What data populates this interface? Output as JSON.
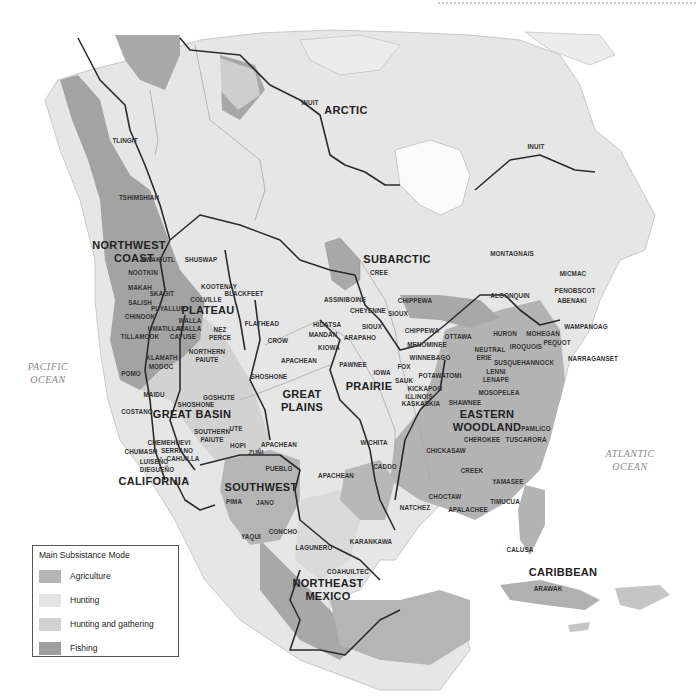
{
  "map": {
    "colors": {
      "agriculture": "#b5b5b5",
      "hunting": "#e4e4e4",
      "hunting_gathering": "#d2d2d2",
      "fishing": "#9e9e9e",
      "boundary": "#2b2b2b",
      "river": "#a9a9a9",
      "ocean": "#ffffff"
    },
    "regions": {
      "arctic": "ARCTIC",
      "subarctic": "SUBARCTIC",
      "northwest_coast_1": "NORTHWEST",
      "northwest_coast_2": "COAST",
      "plateau": "PLATEAU",
      "great_basin": "GREAT BASIN",
      "great_plains_1": "GREAT",
      "great_plains_2": "PLAINS",
      "prairie": "PRAIRIE",
      "eastern_woodland_1": "EASTERN",
      "eastern_woodland_2": "WOODLAND",
      "california": "CALIFORNIA",
      "southwest": "SOUTHWEST",
      "northeast_mexico_1": "NORTHEAST",
      "northeast_mexico_2": "MEXICO",
      "caribbean": "CARIBBEAN"
    },
    "oceans": {
      "pacific_1": "PACIFIC",
      "pacific_2": "OCEAN",
      "atlantic_1": "ATLANTIC",
      "atlantic_2": "OCEAN"
    },
    "tribes": {
      "inuit_west": "INUIT",
      "inuit_east": "INUIT",
      "tlingit": "TLINGIT",
      "tshimshian": "TSHIMSHIAN",
      "kwakiutl": "KWAKIUTL",
      "nootkin": "NOOTKIN",
      "makah": "MAKAH",
      "salish": "SALISH",
      "chinook": "CHINOOK",
      "tillamook": "TILLAMOOK",
      "skagit": "SKAGIT",
      "puyallup": "PUYALLUP",
      "umatilla": "UMATILLA",
      "walla_walla_1": "WALLA",
      "walla_walla_2": "WALLA",
      "cayuse": "CAYUSE",
      "klamath": "KLAMATH",
      "modoc": "MODOC",
      "pomo": "POMO",
      "shuswap": "SHUSWAP",
      "kootenay": "KOOTENAY",
      "blackfeet": "BLACKFEET",
      "colville": "COLVILLE",
      "nez_perce_1": "NEZ",
      "nez_perce_2": "PERCE",
      "northern_paiute_1": "NORTHERN",
      "northern_paiute_2": "PAIUTE",
      "flathead": "FLATHEAD",
      "crow": "CROW",
      "apachean_north": "APACHEAN",
      "shoshone_plains": "SHOSHONE",
      "maidu": "MAIDU",
      "goshute": "GOSHUTE",
      "shoshone_basin": "SHOSHONE",
      "costano": "COSTANO",
      "southern_paiute_1": "SOUTHERN",
      "southern_paiute_2": "PAIUTE",
      "ute": "UTE",
      "chemehuevi": "CHEMEHUEVI",
      "chumash": "CHUMASH",
      "serrano": "SERRANO",
      "cahuilla": "CAHUILLA",
      "luiseno": "LUISEÑO",
      "diegueno": "DIEGUEÑO",
      "hopi": "HOPI",
      "zuni": "ZUÑI",
      "apachean_sw": "APACHEAN",
      "pueblo": "PUEBLO",
      "pima": "PIMA",
      "jano": "JANO",
      "concho": "CONCHO",
      "yaqui": "YAQUI",
      "lagunero": "LAGUNERO",
      "coahuiltec": "COAHUILTEC",
      "karankawa": "KARANKAWA",
      "apachean_south": "APACHEAN",
      "wichita": "WICHITA",
      "caddo": "CADDO",
      "cree": "CREE",
      "assiniboine": "ASSINIBOINE",
      "cheyenne": "CHEYENNE",
      "sioux_north": "SIOUX",
      "sioux_south": "SIOUX",
      "hidatsa": "HIDATSA",
      "mandan": "MANDAN",
      "kiowa": "KIOWA",
      "arapaho": "ARAPAHO",
      "pawnee": "PAWNEE",
      "iowa": "IOWA",
      "chippewa_north": "CHIPPEWA",
      "chippewa_south": "CHIPPEWA",
      "menominee": "MENOMINEE",
      "winnebago": "WINNEBAGO",
      "fox": "FOX",
      "sauk": "SAUK",
      "potawatomi": "POTAWATOMI",
      "kickapoo": "KICKAPOO",
      "illinois": "ILLINOIS",
      "kaskaskia": "KASKASKIA",
      "ottawa": "OTTAWA",
      "montagnais": "MONTAGNAIS",
      "micmac": "MICMAC",
      "penobscot": "PENOBSCOT",
      "abenaki": "ABENAKI",
      "algonquin": "ALGONQUIN",
      "wampanoag": "WAMPANOAG",
      "huron": "HURON",
      "mohegan": "MOHEGAN",
      "pequot": "PEQUOT",
      "iroquois": "IROQUOIS",
      "narraganset": "NARRAGANSET",
      "neutral": "NEUTRAL",
      "erie": "ERIE",
      "susquehannock": "SUSQUEHANNOCK",
      "lenni_1": "LENNI",
      "lenni_2": "LENAPE",
      "mosopelea": "MOSOPELEA",
      "shawnee": "SHAWNEE",
      "pamlico": "PAMLICO",
      "cherokee": "CHEROKEE",
      "tuscarora": "TUSCARORA",
      "chickasaw": "CHICKASAW",
      "creek": "CREEK",
      "yamasee": "YAMASEE",
      "choctaw": "CHOCTAW",
      "natchez": "NATCHEZ",
      "apalachee": "APALACHEE",
      "timucua": "TIMUCUA",
      "calusa": "CALUSA",
      "arawak": "ARAWAK"
    }
  },
  "legend": {
    "title": "Main Subsistance Mode",
    "items": [
      {
        "label": "Agriculture",
        "color": "#b5b5b5"
      },
      {
        "label": "Hunting",
        "color": "#e4e4e4"
      },
      {
        "label": "Hunting and gathering",
        "color": "#d2d2d2"
      },
      {
        "label": "Fishing",
        "color": "#9e9e9e"
      }
    ]
  }
}
